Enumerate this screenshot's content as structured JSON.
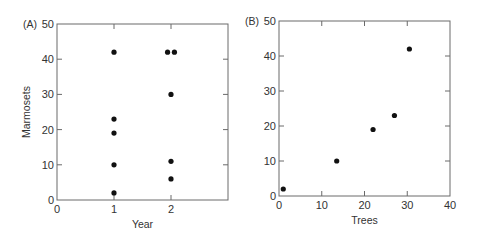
{
  "chart_data": [
    {
      "type": "scatter",
      "panel_label": "(A)",
      "title": "",
      "xlabel": "Year",
      "ylabel": "Marmosets",
      "xlim": [
        0,
        3
      ],
      "ylim": [
        0,
        50
      ],
      "xticks": [
        0,
        1,
        2
      ],
      "yticks": [
        0,
        10,
        20,
        30,
        40,
        50
      ],
      "grid": false,
      "points": [
        {
          "x": 1,
          "y": 42
        },
        {
          "x": 1,
          "y": 23
        },
        {
          "x": 1,
          "y": 19
        },
        {
          "x": 1,
          "y": 10
        },
        {
          "x": 1,
          "y": 2
        },
        {
          "x": 1.94,
          "y": 42
        },
        {
          "x": 2.06,
          "y": 42
        },
        {
          "x": 2,
          "y": 30
        },
        {
          "x": 2,
          "y": 11
        },
        {
          "x": 2,
          "y": 6
        }
      ]
    },
    {
      "type": "scatter",
      "panel_label": "(B)",
      "title": "",
      "xlabel": "Trees",
      "ylabel": "",
      "xlim": [
        0,
        40
      ],
      "ylim": [
        0,
        50
      ],
      "xticks": [
        0,
        10,
        20,
        30,
        40
      ],
      "yticks": [
        0,
        10,
        20,
        30,
        40,
        50
      ],
      "grid": false,
      "points": [
        {
          "x": 1,
          "y": 2
        },
        {
          "x": 13.5,
          "y": 10
        },
        {
          "x": 22,
          "y": 19
        },
        {
          "x": 27,
          "y": 23
        },
        {
          "x": 30.5,
          "y": 42
        }
      ]
    }
  ]
}
